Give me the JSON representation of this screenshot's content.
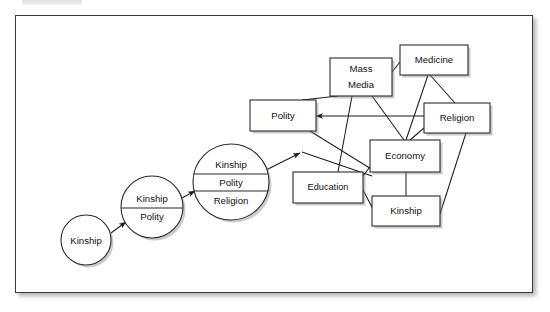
{
  "figure": {
    "name": "societal-institution-differentiation-diagram",
    "frame": {
      "border_color": "#3a3a3a",
      "background": "#ffffff"
    }
  },
  "diagram_data": {
    "type": "diagram",
    "stages": [
      {
        "id": "stage-1",
        "shape": "circle",
        "cx": 86,
        "cy": 240,
        "r": 25,
        "segments": [
          {
            "label": "Kinship",
            "y": 240
          }
        ]
      },
      {
        "id": "stage-2",
        "shape": "circle",
        "cx": 152,
        "cy": 207,
        "r": 31,
        "segments": [
          {
            "label": "Kinship",
            "y": 199
          },
          {
            "label": "Polity",
            "y": 216
          }
        ],
        "dividers": [
          {
            "y": 208
          }
        ]
      },
      {
        "id": "stage-3",
        "shape": "circle",
        "cx": 231,
        "cy": 182,
        "r": 38,
        "segments": [
          {
            "label": "Kinship",
            "y": 166
          },
          {
            "label": "Polity",
            "y": 183
          },
          {
            "label": "Religion",
            "y": 200
          }
        ],
        "dividers": [
          {
            "y": 174
          },
          {
            "y": 191
          }
        ]
      }
    ],
    "nodes": [
      {
        "id": "polity",
        "label": "Polity",
        "shape": "rect",
        "x": 250,
        "y": 100,
        "w": 66,
        "h": 31
      },
      {
        "id": "mass-media",
        "label": "Mass\nMedia",
        "lines": [
          "Mass",
          "Media"
        ],
        "shape": "rect",
        "x": 330,
        "y": 58,
        "w": 62,
        "h": 38
      },
      {
        "id": "medicine",
        "label": "Medicine",
        "shape": "rect",
        "x": 400,
        "y": 45,
        "w": 68,
        "h": 30
      },
      {
        "id": "religion",
        "label": "Religion",
        "shape": "rect",
        "x": 424,
        "y": 103,
        "w": 66,
        "h": 30
      },
      {
        "id": "economy",
        "label": "Economy",
        "shape": "rect",
        "x": 370,
        "y": 140,
        "w": 70,
        "h": 32
      },
      {
        "id": "education",
        "label": "Education",
        "shape": "rect",
        "x": 293,
        "y": 172,
        "w": 70,
        "h": 31
      },
      {
        "id": "kinship-box",
        "label": "Kinship",
        "shape": "rect",
        "x": 372,
        "y": 196,
        "w": 68,
        "h": 30
      }
    ],
    "arrows": [
      {
        "from": "stage-1",
        "to": "stage-2",
        "arrowhead": true
      },
      {
        "from": "stage-2",
        "to": "stage-3",
        "arrowhead": true
      },
      {
        "from": "stage-3",
        "to": "network-hub",
        "arrowhead": true
      }
    ],
    "edges": [
      {
        "from": "polity",
        "to": "mass-media"
      },
      {
        "from": "polity",
        "to": "religion"
      },
      {
        "from": "polity",
        "to": "economy"
      },
      {
        "from": "mass-media",
        "to": "medicine"
      },
      {
        "from": "mass-media",
        "to": "economy"
      },
      {
        "from": "mass-media",
        "to": "education"
      },
      {
        "from": "medicine",
        "to": "religion"
      },
      {
        "from": "medicine",
        "to": "economy"
      },
      {
        "from": "religion",
        "to": "economy"
      },
      {
        "from": "religion",
        "to": "kinship-box"
      },
      {
        "from": "economy",
        "to": "kinship-box"
      },
      {
        "from": "education",
        "to": "economy"
      },
      {
        "from": "education",
        "to": "kinship-box"
      }
    ],
    "legend": [],
    "title": "",
    "labels_all": [
      "Kinship",
      "Kinship",
      "Polity",
      "Kinship",
      "Polity",
      "Religion",
      "Polity",
      "Mass",
      "Media",
      "Medicine",
      "Religion",
      "Economy",
      "Education",
      "Kinship"
    ]
  }
}
